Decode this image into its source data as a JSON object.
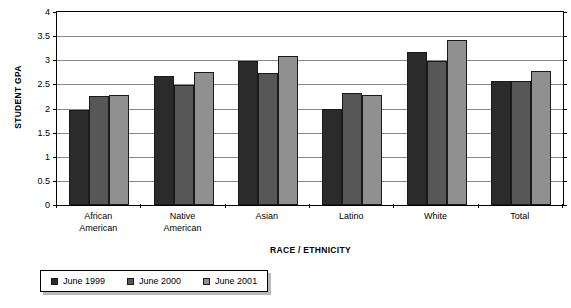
{
  "chart_data": {
    "type": "bar",
    "title": "",
    "xlabel": "RACE / ETHNICITY",
    "ylabel": "STUDENT GPA",
    "ylim": [
      0,
      4
    ],
    "yticks": [
      0,
      0.5,
      1,
      1.5,
      2,
      2.5,
      3,
      3.5,
      4
    ],
    "ytick_labels": [
      "0",
      "0.5",
      "1",
      "1.5",
      "2",
      "2.5",
      "3",
      "3.5",
      "4"
    ],
    "grid": true,
    "legend_position": "bottom",
    "categories": [
      "African\nAmerican",
      "Native\nAmerican",
      "Asian",
      "Latino",
      "White",
      "Total"
    ],
    "series": [
      {
        "name": "June 1999",
        "color": "#2b2b2b",
        "values": [
          1.96,
          2.68,
          2.98,
          1.98,
          3.18,
          2.58
        ]
      },
      {
        "name": "June 2000",
        "color": "#575757",
        "values": [
          2.25,
          2.48,
          2.74,
          2.32,
          2.98,
          2.57
        ]
      },
      {
        "name": "June 2001",
        "color": "#909090",
        "values": [
          2.28,
          2.75,
          3.08,
          2.28,
          3.43,
          2.77
        ]
      }
    ]
  }
}
